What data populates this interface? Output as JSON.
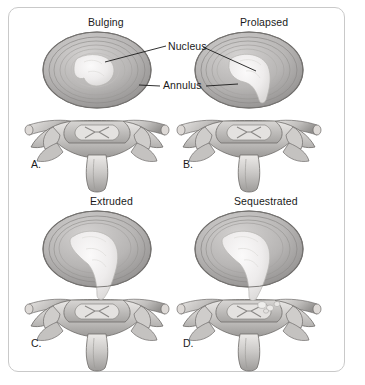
{
  "figure": {
    "background_color": "#ffffff",
    "frame_color": "#c9c9c9",
    "style": "grayscale medical illustration, axial cross-section of lumbar vertebra and disc"
  },
  "callouts": [
    {
      "id": "nucleus",
      "label": "Nucleus",
      "x": 168,
      "y": 47
    },
    {
      "id": "annulus",
      "label": "Annulus",
      "x": 163,
      "y": 86
    }
  ],
  "panels": [
    {
      "letter": "A.",
      "title": "Bulging",
      "letter_x": 31,
      "letter_y": 158,
      "title_x": 88,
      "title_y": 17,
      "center_x": 97,
      "center_y": 70,
      "description": "Annulus bulges symmetrically; nucleus remains contained and centered"
    },
    {
      "letter": "B.",
      "title": "Prolapsed",
      "letter_x": 183,
      "letter_y": 158,
      "title_x": 240,
      "title_y": 17,
      "center_x": 249,
      "center_y": 70,
      "description": "Nucleus migrates posteriorly forming a tail through inner annular fibres"
    },
    {
      "letter": "C.",
      "title": "Extruded",
      "letter_x": 31,
      "letter_y": 337,
      "title_x": 90,
      "title_y": 196,
      "center_x": 97,
      "center_y": 249,
      "description": "Nucleus breaches the outer annulus and extrudes toward the spinal canal"
    },
    {
      "letter": "D.",
      "title": "Sequestrated",
      "letter_x": 183,
      "letter_y": 337,
      "title_x": 234,
      "title_y": 196,
      "center_x": 249,
      "center_y": 249,
      "description": "Free fragment of nucleus separates into the spinal canal"
    }
  ],
  "colors": {
    "annulus_outer": "#9a9a9a",
    "annulus_mid": "#b2b2b2",
    "annulus_inner": "#c8c8c8",
    "nucleus": "#eceaea",
    "bone_light": "#e2e0de",
    "bone_mid": "#bdbbb9",
    "bone_dark": "#8e8c8a",
    "outline": "#5f5d5b",
    "text": "#1a1a1a"
  }
}
